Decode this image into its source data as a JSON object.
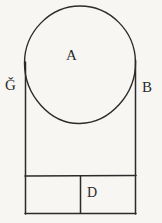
{
  "figure": {
    "kind": "geometry-diagram",
    "background_color": "#f7f6f3",
    "stroke_color": "#2b2b2b",
    "width": 162,
    "height": 223,
    "labels": {
      "circle": "A",
      "left_side": "Ǧ",
      "right_side": "B",
      "bottom_right_cell": "D"
    },
    "shapes": {
      "outer_rectangle": {
        "name": "outer-rectangle",
        "x": 25,
        "y": 62,
        "width": 111,
        "height": 152
      },
      "circle": {
        "name": "inscribed-circle",
        "cx": 80,
        "cy": 64,
        "r": 56
      },
      "bottom_divider_y": 176,
      "bottom_vertical_divider_x": 80
    }
  }
}
